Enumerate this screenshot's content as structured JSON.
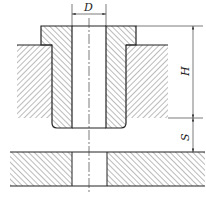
{
  "diagram": {
    "labels": {
      "diameter": "D",
      "height": "H",
      "gap": "S"
    },
    "colors": {
      "line": "#222222",
      "hatch": "#555555",
      "background": "#ffffff"
    }
  }
}
